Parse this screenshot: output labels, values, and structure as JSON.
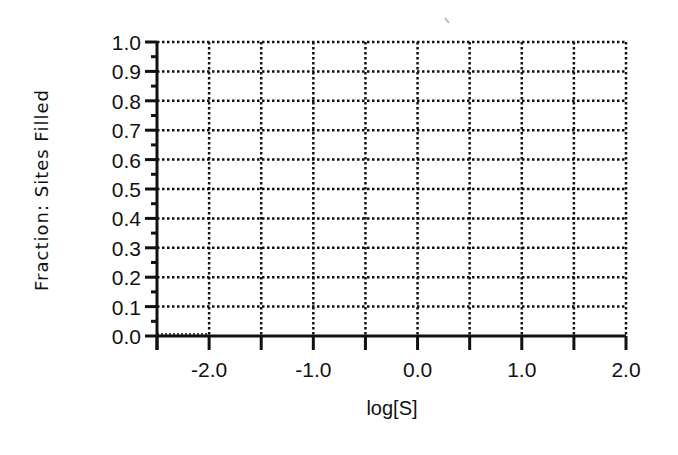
{
  "chart_data": {
    "type": "line",
    "title": "",
    "xlabel": "log[S]",
    "ylabel": "Fraction: Sites Filled",
    "xlim": [
      -2.5,
      2.0
    ],
    "ylim": [
      0.0,
      1.0
    ],
    "grid": true,
    "grid_style": "dotted",
    "x_ticks": [
      -2.5,
      -2.0,
      -1.5,
      -1.0,
      -0.5,
      0.0,
      0.5,
      1.0,
      1.5,
      2.0
    ],
    "x_tick_labels": [
      {
        "value": -2.0,
        "label": "-2.0"
      },
      {
        "value": -1.0,
        "label": "-1.0"
      },
      {
        "value": 0.0,
        "label": "0.0"
      },
      {
        "value": 1.0,
        "label": "1.0"
      },
      {
        "value": 2.0,
        "label": "2.0"
      }
    ],
    "y_ticks": [
      0.0,
      0.1,
      0.2,
      0.3,
      0.4,
      0.5,
      0.6,
      0.7,
      0.8,
      0.9,
      1.0
    ],
    "y_tick_labels": [
      "0.0",
      "0.1",
      "0.2",
      "0.3",
      "0.4",
      "0.5",
      "0.6",
      "0.7",
      "0.8",
      "0.9",
      "1.0"
    ],
    "y_minor_ticks": [
      0.05,
      0.15,
      0.25,
      0.35,
      0.45,
      0.55,
      0.65,
      0.75,
      0.85,
      0.95
    ],
    "series": [],
    "colors": {
      "ink": "#111111",
      "background": "#ffffff"
    }
  }
}
